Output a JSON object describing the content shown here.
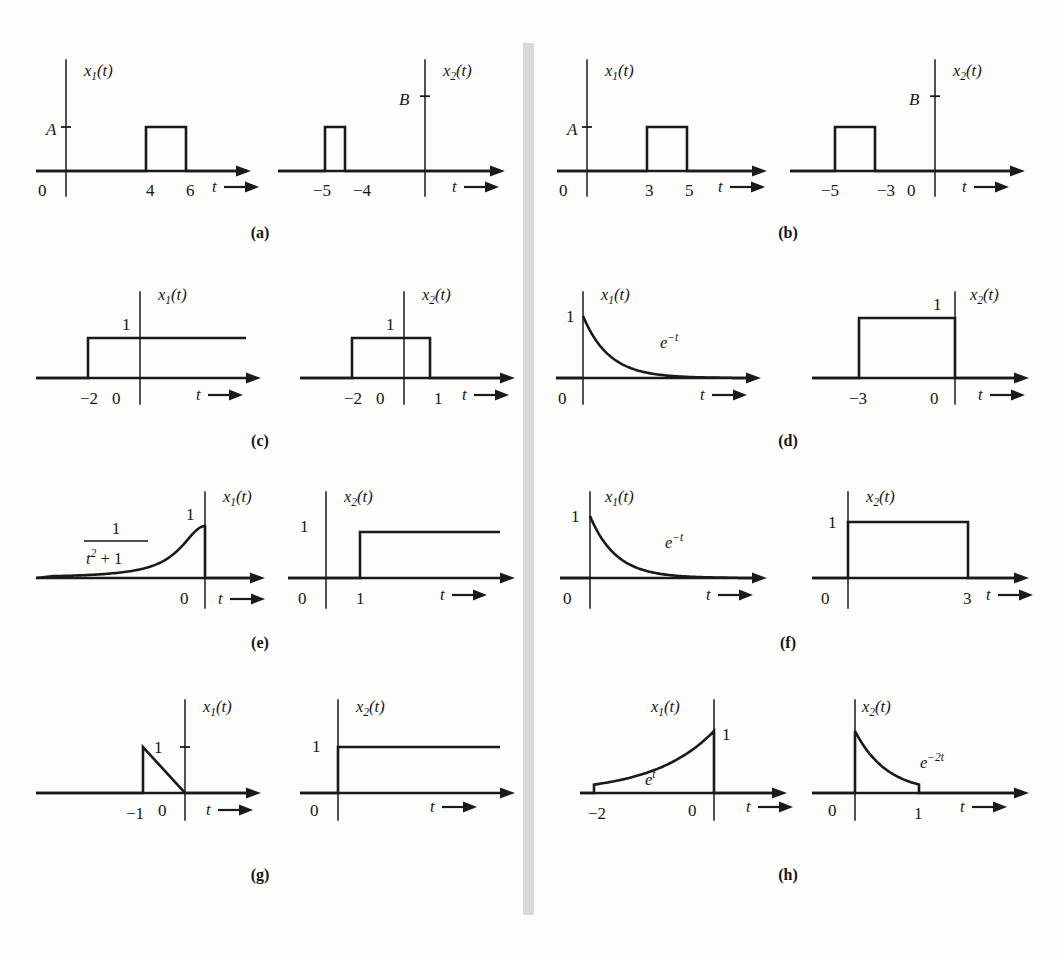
{
  "figure": {
    "kind": "signal-plot-grid",
    "panel_count": 8,
    "divider": {
      "color": "#d8d8d8",
      "x": 523,
      "y": 43,
      "width": 11,
      "height": 872
    }
  },
  "axis_labels": {
    "t": "t",
    "x1": "x",
    "x2": "x",
    "x1_sub": "1",
    "x2_sub": "2",
    "paren": "(t)"
  },
  "chart_data": {
    "type": "line",
    "title": "",
    "xlabel": "t",
    "ylabel": "",
    "grid": false,
    "legend": "none",
    "panels": [
      {
        "id": "a",
        "label": "(a)",
        "plots": [
          {
            "name": "x1",
            "signal_label": "x_1(t)",
            "type": "rect-pulse",
            "origin_label": "0",
            "xticks": [
              "4",
              "6"
            ],
            "ytick_label": "A",
            "description": "rectangular pulse of height A from t=4 to t=6"
          },
          {
            "name": "x2",
            "signal_label": "x_2(t)",
            "type": "rect-pulse",
            "origin_label": "",
            "xticks": [
              "-5",
              "-4"
            ],
            "ytick_label": "B",
            "description": "rectangular pulse of height B from t=-5 to t=-4"
          }
        ]
      },
      {
        "id": "b",
        "label": "(b)",
        "plots": [
          {
            "name": "x1",
            "signal_label": "x_1(t)",
            "type": "rect-pulse",
            "origin_label": "0",
            "xticks": [
              "3",
              "5"
            ],
            "ytick_label": "A",
            "description": "rectangular pulse of height A from t=3 to t=5"
          },
          {
            "name": "x2",
            "signal_label": "x_2(t)",
            "type": "rect-pulse",
            "origin_label": "0",
            "xticks": [
              "-5",
              "-3"
            ],
            "ytick_label": "B",
            "description": "rectangular pulse of height B from t=-5 to t=-3"
          }
        ]
      },
      {
        "id": "c",
        "label": "(c)",
        "plots": [
          {
            "name": "x1",
            "signal_label": "x_1(t)",
            "type": "step",
            "origin_label": "0",
            "xticks": [
              "-2"
            ],
            "ytick_label": "1",
            "description": "unit step rising at t=-2, continues to the right"
          },
          {
            "name": "x2",
            "signal_label": "x_2(t)",
            "type": "rect-pulse",
            "origin_label": "0",
            "xticks": [
              "-2",
              "1"
            ],
            "ytick_label": "1",
            "description": "unit rectangular pulse from t=-2 to t=1"
          }
        ]
      },
      {
        "id": "d",
        "label": "(d)",
        "plots": [
          {
            "name": "x1",
            "signal_label": "x_1(t)",
            "type": "exp-decay",
            "origin_label": "0",
            "xticks": [],
            "ytick_label": "1",
            "curve_label": "e^{-t}",
            "description": "decaying exponential e^-t for t >= 0, starting at 1"
          },
          {
            "name": "x2",
            "signal_label": "x_2(t)",
            "type": "rect-pulse",
            "origin_label": "0",
            "xticks": [
              "-3"
            ],
            "ytick_label": "1",
            "description": "unit rectangular pulse from t=-3 to t=0"
          }
        ]
      },
      {
        "id": "e",
        "label": "(e)",
        "plots": [
          {
            "name": "x1",
            "signal_label": "x_1(t)",
            "type": "lorentzian-rise",
            "origin_label": "0",
            "xticks": [],
            "ytick_label": "1",
            "curve_label_num": "1",
            "curve_label_den": "t^2 + 1",
            "description": "1/(t^2+1) rising to 1 at t=0 then dropping to zero"
          },
          {
            "name": "x2",
            "signal_label": "x_2(t)",
            "type": "step",
            "origin_label": "0",
            "xticks": [
              "1"
            ],
            "ytick_label": "1",
            "description": "unit step rising at t=1"
          }
        ]
      },
      {
        "id": "f",
        "label": "(f)",
        "plots": [
          {
            "name": "x1",
            "signal_label": "x_1(t)",
            "type": "exp-decay",
            "origin_label": "0",
            "xticks": [],
            "ytick_label": "1",
            "curve_label": "e^{-t}",
            "description": "decaying exponential e^-t for t >= 0, starting at 1"
          },
          {
            "name": "x2",
            "signal_label": "x_2(t)",
            "type": "rect-pulse",
            "origin_label": "0",
            "xticks": [
              "3"
            ],
            "ytick_label": "1",
            "description": "unit rectangular pulse from t=0 to t=3"
          }
        ]
      },
      {
        "id": "g",
        "label": "(g)",
        "plots": [
          {
            "name": "x1",
            "signal_label": "x_1(t)",
            "type": "ramp-down",
            "origin_label": "0",
            "xticks": [
              "-1"
            ],
            "ytick_label": "1",
            "description": "triangular ramp from height 1 at t=-1 decreasing to 0 at t=0"
          },
          {
            "name": "x2",
            "signal_label": "x_2(t)",
            "type": "step",
            "origin_label": "0",
            "xticks": [],
            "ytick_label": "1",
            "description": "unit step rising at t=0"
          }
        ]
      },
      {
        "id": "h",
        "label": "(h)",
        "plots": [
          {
            "name": "x1",
            "signal_label": "x_1(t)",
            "type": "exp-rise",
            "origin_label": "0",
            "xticks": [
              "-2"
            ],
            "ytick_label": "1",
            "curve_label": "e^{t}",
            "description": "rising exponential e^t from t=-2 to t=0 reaching 1"
          },
          {
            "name": "x2",
            "signal_label": "x_2(t)",
            "type": "exp-decay-trunc",
            "origin_label": "0",
            "xticks": [
              "1"
            ],
            "ytick_label": "",
            "curve_label": "e^{-2t}",
            "description": "decaying exponential e^-2t from t=0 truncated at t=1"
          }
        ]
      }
    ]
  }
}
